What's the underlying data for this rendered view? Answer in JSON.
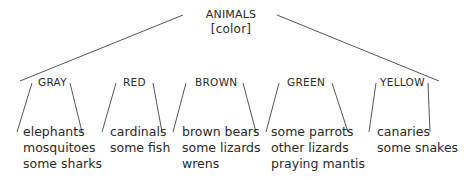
{
  "root": {
    "label": "ANIMALS",
    "sublabel": "[color]"
  },
  "categories": [
    {
      "label": "GRAY",
      "items": [
        "elephants",
        "mosquitoes",
        "some sharks"
      ]
    },
    {
      "label": "RED",
      "items": [
        "cardinals",
        "some fish"
      ]
    },
    {
      "label": "BROWN",
      "items": [
        "brown bears",
        "some lizards",
        "wrens"
      ]
    },
    {
      "label": "GREEN",
      "items": [
        "some parrots",
        "other lizards",
        "praying mantis"
      ]
    },
    {
      "label": "YELLOW",
      "items": [
        "canaries",
        "some snakes"
      ]
    }
  ],
  "colors": {
    "line": "#555555",
    "text": "#2a2a2a"
  }
}
